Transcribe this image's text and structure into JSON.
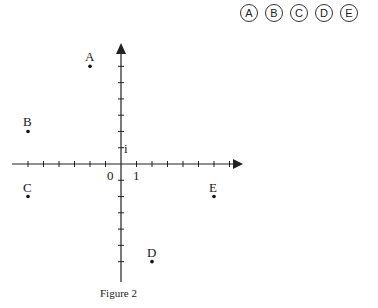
{
  "answer_choices": [
    "A",
    "B",
    "C",
    "D",
    "E"
  ],
  "figure": {
    "caption": "Figure 2",
    "origin_label": "0",
    "x_unit_label": "1",
    "y_unit_label": "i",
    "points": [
      {
        "label": "A",
        "x": -2,
        "y": 6
      },
      {
        "label": "B",
        "x": -6,
        "y": 2
      },
      {
        "label": "C",
        "x": -6,
        "y": -2
      },
      {
        "label": "D",
        "x": 2,
        "y": -6
      },
      {
        "label": "E",
        "x": 6,
        "y": -2
      }
    ]
  }
}
